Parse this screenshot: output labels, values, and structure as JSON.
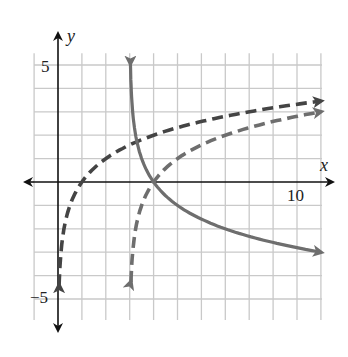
{
  "chart_data": {
    "type": "line",
    "title": "",
    "xlabel": "x",
    "ylabel": "y",
    "xlim": [
      -1,
      11
    ],
    "ylim": [
      -6,
      6
    ],
    "grid": true,
    "x_tick_labels": [
      {
        "value": 10,
        "label": "10"
      }
    ],
    "y_tick_labels": [
      {
        "value": 5,
        "label": "5"
      },
      {
        "value": -5,
        "label": "−5"
      }
    ],
    "series": [
      {
        "name": "y = log2(x)",
        "style": "dashed",
        "color": "#444444",
        "asymptote_x": 0,
        "x": [
          0.05,
          0.1,
          0.25,
          0.5,
          1,
          2,
          3,
          4,
          6,
          8,
          11
        ],
        "y": [
          -4.32,
          -3.32,
          -2.0,
          -1.0,
          0,
          1,
          1.58,
          2,
          2.58,
          3,
          3.46
        ]
      },
      {
        "name": "y = log2(x - 3)",
        "style": "dashed",
        "color": "#6e6e6e",
        "asymptote_x": 3,
        "x": [
          3.05,
          3.1,
          3.25,
          3.5,
          4,
          5,
          7,
          9,
          11
        ],
        "y": [
          -4.32,
          -3.32,
          -2.0,
          -1.0,
          0,
          1,
          2,
          2.58,
          3
        ]
      },
      {
        "name": "y = log1/2(x - 3)",
        "style": "solid",
        "color": "#6e6e6e",
        "asymptote_x": 3,
        "x": [
          3.03,
          3.1,
          3.25,
          3.5,
          4,
          5,
          7,
          9,
          11
        ],
        "y": [
          5.06,
          3.32,
          2.0,
          1.0,
          0,
          -1,
          -2,
          -2.58,
          -3
        ]
      }
    ]
  },
  "axes": {
    "x_name": "x",
    "y_name": "y",
    "x_tick": "10",
    "y_tick_top": "5",
    "y_tick_bottom": "−5"
  }
}
